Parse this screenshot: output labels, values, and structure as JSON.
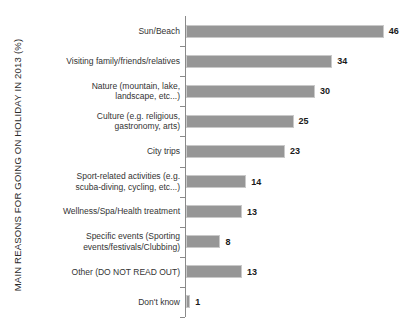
{
  "chart_data": {
    "type": "bar",
    "orientation": "horizontal",
    "title": "",
    "xlabel": "",
    "ylabel": "MAIN REASONS FOR GOING ON HOLIDAY IN 2013 (%)",
    "xlim": [
      0,
      50
    ],
    "grid": false,
    "legend": null,
    "value_suffix": "",
    "bar_color": "#969696",
    "bar_border_color": "#c9c9c9",
    "categories": [
      "Sun/Beach",
      "Visiting family/friends/relatives",
      "Nature (mountain, lake, landscape, etc...)",
      "Culture (e.g. religious, gastronomy, arts)",
      "City trips",
      "Sport-related activities (e.g. scuba-diving, cycling, etc...)",
      "Wellness/Spa/Health treatment",
      "Specific events (Sporting events/festivals/Clubbing)",
      "Other (DO NOT READ OUT)",
      "Don't know"
    ],
    "values": [
      46,
      34,
      30,
      25,
      23,
      14,
      13,
      8,
      13,
      1
    ]
  },
  "axis": {
    "title": "MAIN REASONS FOR GOING ON HOLIDAY IN 2013 (%)"
  },
  "rows": [
    {
      "label": "Sun/Beach",
      "value": "46"
    },
    {
      "label": "Visiting family/friends/relatives",
      "value": "34"
    },
    {
      "label": "Nature (mountain, lake,\nlandscape, etc...)",
      "value": "30"
    },
    {
      "label": "Culture (e.g. religious,\ngastronomy, arts)",
      "value": "25"
    },
    {
      "label": "City trips",
      "value": "23"
    },
    {
      "label": "Sport-related activities (e.g.\nscuba-diving, cycling, etc...)",
      "value": "14"
    },
    {
      "label": "Wellness/Spa/Health treatment",
      "value": "13"
    },
    {
      "label": "Specific events (Sporting\nevents/festivals/Clubbing)",
      "value": "8"
    },
    {
      "label": "Other (DO NOT READ OUT)",
      "value": "13"
    },
    {
      "label": "Don't know",
      "value": "1"
    }
  ]
}
